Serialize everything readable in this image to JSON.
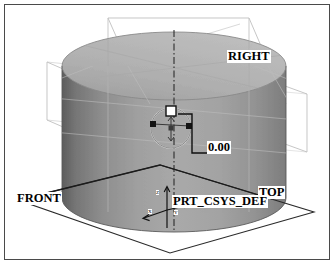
{
  "app": {
    "title": "CAD 3D Model View",
    "kind": "solid-model-viewport"
  },
  "viewport": {
    "background_color": "#ffffff",
    "frame_color": "#4a4a4a",
    "model": {
      "type": "cylinder",
      "shading": "grayscale-gradient",
      "body_color_light": "#b6b6b6",
      "body_color_mid": "#9a9a9a",
      "body_color_dark": "#6f6f6f",
      "top_face_color": "#b0b0b0"
    }
  },
  "labels": {
    "datum_right": "RIGHT",
    "datum_front": "FRONT",
    "datum_top": "TOP",
    "dimension_value": "0.00",
    "coordinate_system": "PRT_CSYS_DEF"
  },
  "axis_tags": {
    "x": "X",
    "y": "Y",
    "z": "Z"
  },
  "features": {
    "sketch_circle": {
      "name": "circle-sketch-entity",
      "handles": [
        "left-drag-handle",
        "right-drag-handle",
        "center-point"
      ]
    },
    "centerline": {
      "style": "dash-dot",
      "orientation": "vertical"
    },
    "dimension_handle": {
      "name": "square-drag-handle"
    }
  },
  "colors": {
    "geometry_line": "#1a1a1a",
    "datum_line": "#c9c9c9",
    "label_text": "#000000",
    "label_background": "#ffffff"
  }
}
